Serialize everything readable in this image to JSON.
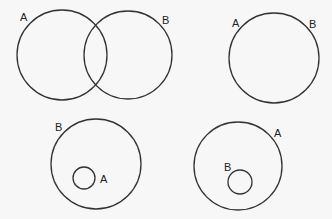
{
  "diagram": {
    "type": "venn",
    "panels": [
      {
        "name": "overlapping-sets",
        "circles": [
          {
            "set": "A",
            "cx": 62,
            "cy": 55,
            "r": 45
          },
          {
            "set": "B",
            "cx": 128,
            "cy": 55,
            "r": 44
          }
        ],
        "labels": [
          {
            "text": "A",
            "x": 20,
            "y": 21
          },
          {
            "text": "B",
            "x": 162,
            "y": 24
          }
        ]
      },
      {
        "name": "equal-sets",
        "circles": [
          {
            "set": "A=B",
            "cx": 274,
            "cy": 58,
            "r": 45
          }
        ],
        "labels": [
          {
            "text": "A",
            "x": 232,
            "y": 27
          },
          {
            "text": "B",
            "x": 309,
            "y": 28
          }
        ]
      },
      {
        "name": "a-subset-of-b",
        "circles": [
          {
            "set": "B",
            "cx": 96,
            "cy": 164,
            "r": 45
          },
          {
            "set": "A",
            "cx": 84,
            "cy": 178,
            "r": 11
          }
        ],
        "labels": [
          {
            "text": "B",
            "x": 55,
            "y": 131
          },
          {
            "text": "A",
            "x": 100,
            "y": 183
          }
        ]
      },
      {
        "name": "b-subset-of-a",
        "circles": [
          {
            "set": "A",
            "cx": 238,
            "cy": 166,
            "r": 44
          },
          {
            "set": "B",
            "cx": 240,
            "cy": 182,
            "r": 12
          }
        ],
        "labels": [
          {
            "text": "A",
            "x": 274,
            "y": 137
          },
          {
            "text": "B",
            "x": 224,
            "y": 171
          }
        ]
      }
    ]
  }
}
